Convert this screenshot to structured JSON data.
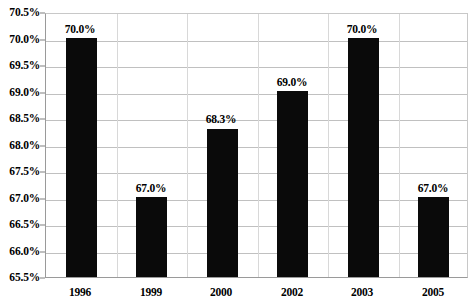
{
  "chart_data": {
    "type": "bar",
    "title": "",
    "subtitle": "",
    "xlabel": "",
    "ylabel": "",
    "categories": [
      "1996",
      "1999",
      "2000",
      "2002",
      "2003",
      "2005"
    ],
    "values": [
      70.0,
      67.0,
      68.3,
      69.0,
      70.0,
      67.0
    ],
    "data_labels": [
      "70.0%",
      "67.0%",
      "68.3%",
      "69.0%",
      "70.0%",
      "67.0%"
    ],
    "ylim": [
      65.5,
      70.5
    ],
    "ytick_step": 0.5,
    "ytick_labels": [
      "70.5%",
      "70.0%",
      "69.5%",
      "69.0%",
      "68.5%",
      "68.0%",
      "67.5%",
      "67.0%",
      "66.5%",
      "66.0%",
      "65.5%"
    ],
    "ytick_values": [
      70.5,
      70.0,
      69.5,
      69.0,
      68.5,
      68.0,
      67.5,
      67.0,
      66.5,
      66.0,
      65.5
    ],
    "grid": true,
    "legend": false,
    "legend_position": "none",
    "bar_color": "#0a0a0a",
    "gridline_color": "#c0c0c0",
    "axis_color": "#9a9a9a",
    "background_color": "#ffffff",
    "text_color": "#000000"
  }
}
